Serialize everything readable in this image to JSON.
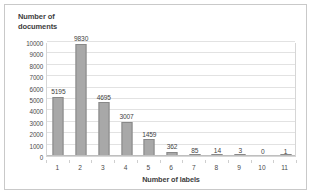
{
  "chart_data": {
    "type": "bar",
    "title": "",
    "xlabel": "Number of labels",
    "ylabel": "Number of documents",
    "categories": [
      "1",
      "2",
      "3",
      "4",
      "5",
      "6",
      "7",
      "8",
      "9",
      "10",
      "11"
    ],
    "values": [
      5195,
      9830,
      4695,
      3007,
      1459,
      362,
      85,
      14,
      3,
      0,
      1
    ],
    "data_labels": [
      "5195",
      "9830",
      "4695",
      "3007",
      "1459",
      "362",
      "85",
      "14",
      "3",
      "0",
      "1"
    ],
    "ylim": [
      0,
      10000
    ],
    "yticks": [
      0,
      1000,
      2000,
      3000,
      4000,
      5000,
      6000,
      7000,
      8000,
      9000,
      10000
    ],
    "ytick_labels": [
      "0",
      "1000",
      "2000",
      "3000",
      "4000",
      "5000",
      "6000",
      "7000",
      "8000",
      "9000",
      "10000"
    ],
    "grid": true,
    "legend": false,
    "bar_color": "#a8a8a8",
    "bar_border_color": "#888888",
    "gridline_color": "#e2e2e2",
    "axis_color": "#bfbfbf",
    "frame_color": "#c9c9c9"
  }
}
